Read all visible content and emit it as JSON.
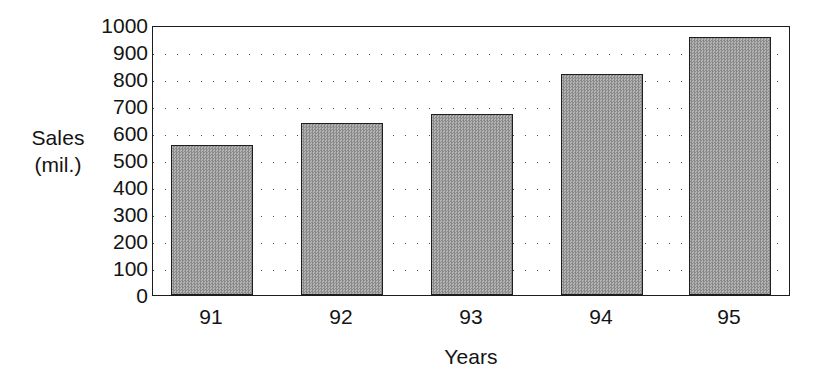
{
  "chart_data": {
    "type": "bar",
    "title": "",
    "categories": [
      "91",
      "92",
      "93",
      "94",
      "95"
    ],
    "values": [
      555,
      637,
      670,
      820,
      955
    ],
    "series": [
      {
        "name": "Sales",
        "values": [
          555,
          637,
          670,
          820,
          955
        ]
      }
    ],
    "xlabel": "Years",
    "ylabel": "Sales (mil.)",
    "ylabel_lines": [
      "Sales",
      "(mil.)"
    ],
    "ylim": [
      0,
      1000
    ],
    "ytick_values": [
      1000,
      900,
      800,
      700,
      600,
      500,
      400,
      300,
      200,
      100,
      0
    ],
    "ytick_labels": [
      "1000",
      "900",
      "800",
      "700",
      "600",
      "500",
      "400",
      "300",
      "200",
      "100",
      "0"
    ],
    "gridline_values": [
      900,
      800,
      700,
      600,
      500,
      400,
      300,
      200,
      100
    ],
    "grid": "horizontal-dotted",
    "legend": "none",
    "bar_fill_color": "#9d9d9d",
    "bar_edge_color": "#1f1f1f",
    "axis_color": "#1c1c1c",
    "background_color": "#ffffff",
    "text_color": "#141414"
  }
}
